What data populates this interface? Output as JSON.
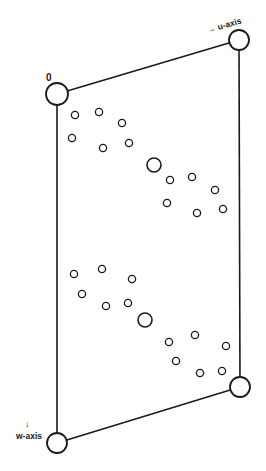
{
  "diagram": {
    "type": "unit-cell-projection",
    "origin_label": "0",
    "u_axis_label": "→ u-axis",
    "w_axis_arrow": "↓",
    "w_axis_label": "w-axis",
    "colors": {
      "line": "#1a1a1a",
      "background": "#ffffff"
    },
    "cell_corners": [
      {
        "name": "origin",
        "x": 57,
        "y": 94,
        "r": 11
      },
      {
        "name": "u-corner",
        "x": 239,
        "y": 40,
        "r": 10
      },
      {
        "name": "uw-corner",
        "x": 240,
        "y": 387,
        "r": 10
      },
      {
        "name": "w-corner",
        "x": 57,
        "y": 443,
        "r": 10
      }
    ],
    "upper_group_atoms": [
      {
        "x": 75,
        "y": 115,
        "r": 3.6
      },
      {
        "x": 99,
        "y": 112,
        "r": 3.6
      },
      {
        "x": 122,
        "y": 123,
        "r": 3.6
      },
      {
        "x": 72,
        "y": 138,
        "r": 3.6
      },
      {
        "x": 103,
        "y": 148,
        "r": 3.6
      },
      {
        "x": 129,
        "y": 143,
        "r": 3.6
      },
      {
        "x": 154,
        "y": 165,
        "r": 7
      },
      {
        "x": 170,
        "y": 180,
        "r": 3.6
      },
      {
        "x": 192,
        "y": 177,
        "r": 3.6
      },
      {
        "x": 215,
        "y": 190,
        "r": 3.6
      },
      {
        "x": 167,
        "y": 203,
        "r": 3.6
      },
      {
        "x": 197,
        "y": 213,
        "r": 3.6
      },
      {
        "x": 223,
        "y": 209,
        "r": 3.6
      }
    ],
    "lower_group_atoms": [
      {
        "x": 74,
        "y": 274,
        "r": 3.6
      },
      {
        "x": 102,
        "y": 269,
        "r": 3.6
      },
      {
        "x": 132,
        "y": 279,
        "r": 3.6
      },
      {
        "x": 82,
        "y": 294,
        "r": 3.6
      },
      {
        "x": 106,
        "y": 306,
        "r": 3.6
      },
      {
        "x": 128,
        "y": 303,
        "r": 3.6
      },
      {
        "x": 145,
        "y": 320,
        "r": 7
      },
      {
        "x": 169,
        "y": 342,
        "r": 3.6
      },
      {
        "x": 195,
        "y": 335,
        "r": 3.6
      },
      {
        "x": 226,
        "y": 346,
        "r": 3.6
      },
      {
        "x": 176,
        "y": 361,
        "r": 3.6
      },
      {
        "x": 200,
        "y": 373,
        "r": 3.6
      },
      {
        "x": 222,
        "y": 371,
        "r": 3.6
      }
    ]
  }
}
